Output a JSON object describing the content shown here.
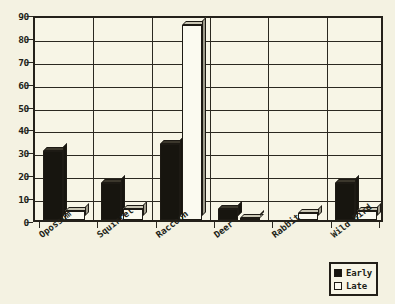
{
  "chart_data": {
    "type": "bar",
    "title": "",
    "xlabel": "",
    "ylabel": "",
    "ylim": [
      0,
      90
    ],
    "ytick_step": 10,
    "yticks": [
      0,
      10,
      20,
      30,
      40,
      50,
      60,
      70,
      80,
      90
    ],
    "grid": true,
    "legend_position": "bottom-right",
    "categories": [
      "Opossum",
      "Squirrel",
      "Raccoon",
      "Deer",
      "Rabbit",
      "Wild Bird"
    ],
    "series": [
      {
        "name": "Early",
        "values": [
          30,
          16,
          33,
          5,
          0,
          16
        ]
      },
      {
        "name": "Late",
        "values": [
          4,
          5,
          85,
          1,
          3,
          4
        ]
      }
    ]
  },
  "legend": {
    "items": [
      {
        "label": "Early",
        "swatch": "filled-square",
        "color": "#17150f"
      },
      {
        "label": "Late",
        "swatch": "empty-square",
        "color": "#fbfaf0"
      }
    ]
  },
  "colors": {
    "background": "#f4f2e2",
    "plot_background": "#f7f5e6",
    "axis": "#24211a",
    "grid": "#2b2820",
    "early_bar": "#17150f",
    "late_bar": "#fbfaf0"
  }
}
